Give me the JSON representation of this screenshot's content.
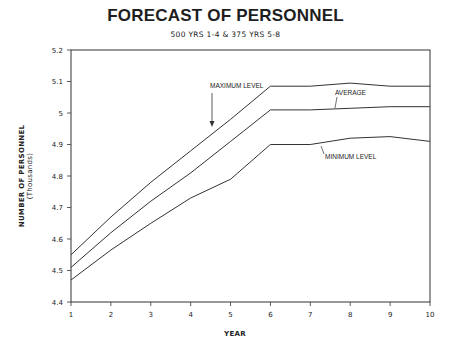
{
  "chart_data": {
    "type": "line",
    "title": "FORECAST OF PERSONNEL",
    "subtitle": "500 YRS 1-4 & 375 YRS 5-8",
    "xlabel": "YEAR",
    "ylabel": "NUMBER OF PERSONNEL",
    "ylabel_units": "(Thousands)",
    "x": [
      1,
      2,
      3,
      4,
      5,
      6,
      7,
      8,
      9,
      10
    ],
    "xlim": [
      1,
      10
    ],
    "ylim": [
      4.4,
      5.2
    ],
    "x_ticks": [
      "1",
      "2",
      "3",
      "4",
      "5",
      "6",
      "7",
      "8",
      "9",
      "10"
    ],
    "y_ticks": [
      "4.4",
      "4.5",
      "4.6",
      "4.7",
      "4.8",
      "4.9",
      "5",
      "5.1",
      "5.2"
    ],
    "grid": false,
    "legend": "none (inline annotations)",
    "series": [
      {
        "name": "MAXIMUM LEVEL",
        "values": [
          4.55,
          4.67,
          4.78,
          4.88,
          4.98,
          5.085,
          5.085,
          5.095,
          5.085,
          5.085
        ]
      },
      {
        "name": "AVERAGE",
        "values": [
          4.51,
          4.62,
          4.72,
          4.81,
          4.91,
          5.01,
          5.01,
          5.015,
          5.02,
          5.02
        ]
      },
      {
        "name": "MINIMUM LEVEL",
        "values": [
          4.47,
          4.565,
          4.65,
          4.73,
          4.79,
          4.9,
          4.9,
          4.92,
          4.925,
          4.91
        ]
      }
    ],
    "annotations": [
      {
        "text": "MAXIMUM LEVEL",
        "series": 0,
        "pointer": "arrow-down"
      },
      {
        "text": "AVERAGE",
        "series": 1,
        "pointer": "line"
      },
      {
        "text": "MINIMUM LEVEL",
        "series": 2,
        "pointer": "line"
      }
    ]
  },
  "colors": {
    "line": "#333333",
    "text": "#222222",
    "background": "#ffffff"
  }
}
